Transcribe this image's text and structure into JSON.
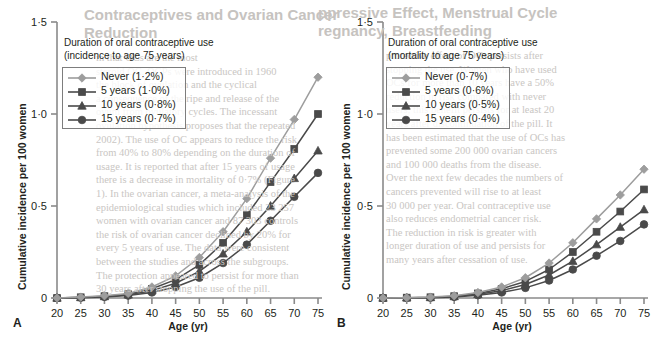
{
  "figure": {
    "panels": [
      {
        "letter": "A",
        "legend_title_line1": "Duration of oral contraceptive use",
        "legend_title_line2": "(incidence to age 75 years)",
        "xlabel": "Age (yr)",
        "ylabel": "Cumulative incidence per 100 women",
        "yticks": [
          "0",
          "0·5",
          "1·0",
          "1·5"
        ],
        "xticks": [
          "20",
          "25",
          "30",
          "35",
          "40",
          "45",
          "50",
          "55",
          "60",
          "65",
          "70",
          "75"
        ]
      },
      {
        "letter": "B",
        "legend_title_line1": "Duration of oral contraceptive use",
        "legend_title_line2": "(mortality to age 75 years)",
        "xlabel": "Age (yr)",
        "ylabel": "Cumulative incidence per 100 women",
        "yticks": [
          "0",
          "0·5",
          "1·0",
          "1·5"
        ],
        "xticks": [
          "20",
          "25",
          "30",
          "35",
          "40",
          "45",
          "50",
          "55",
          "60",
          "65",
          "70",
          "75"
        ]
      }
    ]
  },
  "colors": {
    "never": "#9d9d9d",
    "five_years": "#4a4a4a",
    "ten_years": "#4a4a4a",
    "fifteen_years": "#4a4a4a",
    "axis": "#8a8a8a",
    "text": "#231f20"
  },
  "ghost_text": {
    "panel_a_title_line1": "Contraceptives and Ovarian Cancer",
    "panel_a_title_line2": "Reduction",
    "panel_b_title_line1": "ppressive Effect, Menstrual Cycle",
    "panel_b_title_line2": "regnancy, Breastfeeding",
    "lines_a": [
      "in that OCs are the most",
      "steroid OC. OCPs were introduced in 1960",
      "the block of ovulation and the cyclical",
      "a consequence of the ripe and release of the",
      "ovum from ovulatory cycles. The incessant",
      "ovulation hypothesis proposes that the repeated",
      "2002). The use of OC appears to reduce the risk",
      "from 40% to 80% depending on the duration of",
      "usage. It is reported that after 15 years of usage",
      "there is a decrease in mortality of 0·7% (Figure",
      "1). In the ovarian cancer, a meta-analysis of the",
      "epidemiological studies which included 23 257",
      "women with ovarian cancer and 87 303 controls",
      "the risk of ovarian cancer declined by 20% for",
      "every 5 years of use. The data were consistent",
      "between the studies and across the subgroups.",
      "The protection appeared to persist for more than",
      "30 years after stopping the use of the pill."
    ],
    "lines_b": [
      "protective effect of OCs persists after",
      "stopping the use. Women who have used",
      "OCs for more than 10 years have a 50%",
      "reduction in risk compared with never",
      "users; this benefit persists for at least 20",
      "years after discontinuation of the pill. It",
      "has been estimated that the use of OCs has",
      "prevented some 200 000 ovarian cancers",
      "and 100 000 deaths from the disease.",
      "Over the next few decades the numbers of",
      "cancers prevented will rise to at least",
      "30 000 per year. Oral contraceptive use",
      "also reduces endometrial cancer risk.",
      "The reduction in risk is greater with",
      "longer duration of use and persists for",
      "many years after cessation of use."
    ]
  },
  "chart_data": [
    {
      "type": "line",
      "panel": "A",
      "title": "Duration of oral contraceptive use (incidence to age 75 years)",
      "xlabel": "Age (yr)",
      "ylabel": "Cumulative incidence per 100 women",
      "xlim": [
        20,
        75
      ],
      "ylim": [
        0,
        1.5
      ],
      "yticks": [
        0,
        0.5,
        1.0,
        1.5
      ],
      "grid": false,
      "legend_position": "upper-left",
      "x": [
        20,
        25,
        30,
        35,
        40,
        45,
        50,
        55,
        60,
        65,
        70,
        75
      ],
      "series": [
        {
          "name": "Never (1·2%)",
          "label": "Never",
          "endpoint_percent": "1·2%",
          "marker": "diamond",
          "color": "#9d9d9d",
          "values": [
            0.0,
            0.005,
            0.012,
            0.025,
            0.06,
            0.12,
            0.22,
            0.36,
            0.54,
            0.76,
            0.97,
            1.2
          ]
        },
        {
          "name": "5 years (1·0%)",
          "label": "5 years",
          "endpoint_percent": "1·0%",
          "marker": "square",
          "color": "#4a4a4a",
          "values": [
            0.0,
            0.004,
            0.01,
            0.021,
            0.05,
            0.1,
            0.18,
            0.3,
            0.45,
            0.63,
            0.81,
            1.0
          ]
        },
        {
          "name": "10 years (0·8%)",
          "label": "10 years",
          "endpoint_percent": "0·8%",
          "marker": "triangle",
          "color": "#4a4a4a",
          "values": [
            0.0,
            0.003,
            0.008,
            0.017,
            0.04,
            0.08,
            0.145,
            0.24,
            0.36,
            0.5,
            0.65,
            0.8
          ]
        },
        {
          "name": "15 years (0·7%)",
          "label": "15 years",
          "endpoint_percent": "0·7%",
          "marker": "circle",
          "color": "#4a4a4a",
          "values": [
            0.0,
            0.002,
            0.006,
            0.013,
            0.03,
            0.06,
            0.11,
            0.19,
            0.29,
            0.42,
            0.55,
            0.68
          ]
        }
      ]
    },
    {
      "type": "line",
      "panel": "B",
      "title": "Duration of oral contraceptive use (mortality to age 75 years)",
      "xlabel": "Age (yr)",
      "ylabel": "Cumulative incidence per 100 women",
      "xlim": [
        20,
        75
      ],
      "ylim": [
        0,
        1.5
      ],
      "yticks": [
        0,
        0.5,
        1.0,
        1.5
      ],
      "grid": false,
      "legend_position": "upper-left",
      "x": [
        20,
        25,
        30,
        35,
        40,
        45,
        50,
        55,
        60,
        65,
        70,
        75
      ],
      "series": [
        {
          "name": "Never (0·7%)",
          "label": "Never",
          "endpoint_percent": "0·7%",
          "marker": "diamond",
          "color": "#9d9d9d",
          "values": [
            0.0,
            0.002,
            0.005,
            0.012,
            0.03,
            0.06,
            0.11,
            0.19,
            0.3,
            0.43,
            0.56,
            0.7
          ]
        },
        {
          "name": "5 years (0·6%)",
          "label": "5 years",
          "endpoint_percent": "0·6%",
          "marker": "square",
          "color": "#4a4a4a",
          "values": [
            0.0,
            0.002,
            0.004,
            0.01,
            0.025,
            0.05,
            0.09,
            0.155,
            0.25,
            0.36,
            0.47,
            0.59
          ]
        },
        {
          "name": "10 years (0·5%)",
          "label": "10 years",
          "endpoint_percent": "0·5%",
          "marker": "triangle",
          "color": "#4a4a4a",
          "values": [
            0.0,
            0.001,
            0.003,
            0.008,
            0.02,
            0.04,
            0.073,
            0.125,
            0.2,
            0.29,
            0.385,
            0.48
          ]
        },
        {
          "name": "15 years (0·4%)",
          "label": "15 years",
          "endpoint_percent": "0·4%",
          "marker": "circle",
          "color": "#4a4a4a",
          "values": [
            0.0,
            0.001,
            0.002,
            0.006,
            0.015,
            0.03,
            0.055,
            0.095,
            0.155,
            0.23,
            0.31,
            0.4
          ]
        }
      ]
    }
  ]
}
